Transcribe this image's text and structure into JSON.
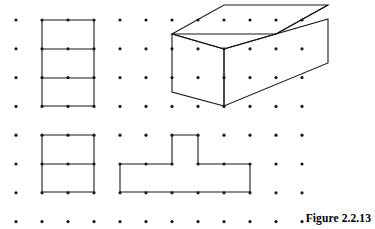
{
  "figure": {
    "caption": "Figure 2.2.13",
    "width": 375,
    "height": 229,
    "background_color": "#ffffff",
    "ink_color": "#000000"
  },
  "grid": {
    "label": "isometric-dot-grid",
    "columns": 12,
    "rows": 8,
    "origin_x": 16,
    "origin_y": 20,
    "spacing_x": 26,
    "spacing_y": 28.8,
    "dot_radius": 1.6,
    "dot_color": "#1a1a1a"
  },
  "shapes": [
    {
      "id": "top-left-divided-rectangle",
      "name": "Divided rectangle, two columns by three rows",
      "type": "polyline-set",
      "stroke": "#1a1a1a",
      "stroke_width": 1.1,
      "paths": [
        "M 42,20 L 94,20 L 94,106 L 42,106 Z",
        "M 42,49 L 94,49",
        "M 42,78 L 94,78"
      ]
    },
    {
      "id": "top-right-isometric-box",
      "name": "Isometric rectangular prism (box)",
      "type": "polyline-set",
      "stroke": "#1a1a1a",
      "stroke_width": 1.1,
      "paths": [
        "M 172,34 L 224,5 L 328,5 L 276,34 Z",
        "M 172,34 L 172,92 L 224,106 L 224,49 Z",
        "M 224,49 L 224,106 L 328,63 L 328,19 Z",
        "M 276,34 L 328,5",
        "M 172,34 L 224,49 L 276,34"
      ]
    },
    {
      "id": "bottom-left-divided-square",
      "name": "Divided square, two by two with mid line",
      "type": "polyline-set",
      "stroke": "#1a1a1a",
      "stroke_width": 1.1,
      "paths": [
        "M 42,135 L 94,135 L 94,192 L 42,192 Z",
        "M 42,164 L 94,164"
      ]
    },
    {
      "id": "bottom-right-t-shape",
      "name": "T-shaped polygon",
      "type": "polyline-set",
      "stroke": "#1a1a1a",
      "stroke_width": 1.1,
      "paths": [
        "M 120,164 L 172,164 L 172,135 L 198,135 L 198,164 L 250,164 L 250,192 L 120,192 Z"
      ]
    }
  ]
}
